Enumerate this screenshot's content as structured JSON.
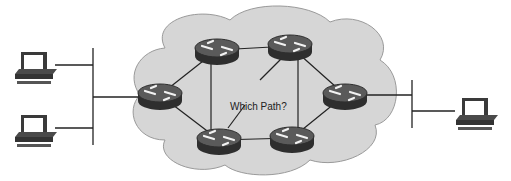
{
  "diagram": {
    "question_label": "Which Path?",
    "colors": {
      "cloud_fill": "#d6d6d6",
      "cloud_stroke": "#9a9a9a",
      "router_body": "#3a3a3a",
      "router_top": "#5a5a5a",
      "link": "#222222",
      "arrow": "#f2f2f2"
    },
    "routers": [
      {
        "id": "R1",
        "x": 160,
        "y": 95
      },
      {
        "id": "R2",
        "x": 217,
        "y": 50
      },
      {
        "id": "R3",
        "x": 290,
        "y": 46
      },
      {
        "id": "R4",
        "x": 345,
        "y": 95
      },
      {
        "id": "R5",
        "x": 292,
        "y": 138
      },
      {
        "id": "R6",
        "x": 219,
        "y": 140
      }
    ],
    "links": [
      [
        "R1",
        "R2"
      ],
      [
        "R2",
        "R3"
      ],
      [
        "R3",
        "R4"
      ],
      [
        "R4",
        "R5"
      ],
      [
        "R5",
        "R6"
      ],
      [
        "R6",
        "R1"
      ],
      [
        "R2",
        "R6"
      ],
      [
        "R3",
        "R5"
      ],
      [
        "R3",
        "R6"
      ]
    ],
    "left_hosts": [
      {
        "x": 35,
        "y": 65
      },
      {
        "x": 35,
        "y": 130
      }
    ],
    "right_hosts": [
      {
        "x": 470,
        "y": 113
      }
    ]
  }
}
